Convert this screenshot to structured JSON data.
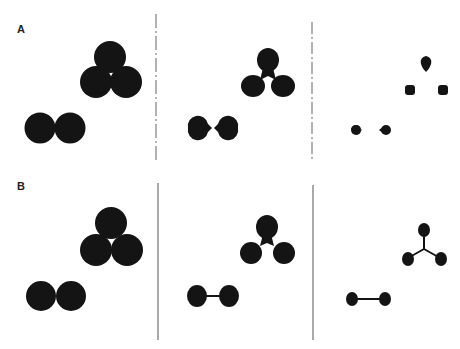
{
  "figure": {
    "row_a": {
      "label": "A"
    },
    "row_b": {
      "label": "B"
    }
  },
  "colors": {
    "ink": "#141414",
    "divider": "#555555",
    "background": "#ffffff"
  }
}
